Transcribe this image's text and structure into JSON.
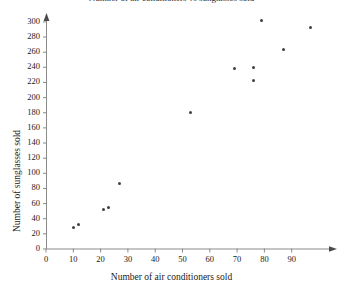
{
  "chart_data": {
    "type": "scatter",
    "title": "Number of air conditioners vs sunglasses sold",
    "xlabel": "Number of air conditioners sold",
    "ylabel": "Number of sunglasses sold",
    "xlim": [
      0,
      100
    ],
    "ylim": [
      0,
      310
    ],
    "xticks": [
      0,
      10,
      20,
      30,
      40,
      50,
      60,
      70,
      80,
      90
    ],
    "yticks": [
      0,
      20,
      40,
      60,
      80,
      100,
      120,
      140,
      160,
      180,
      200,
      220,
      240,
      260,
      280,
      300
    ],
    "grid": false,
    "legend": null,
    "marker_color": "#3f3f48",
    "axis_color": "#808080",
    "points": [
      {
        "x": 10,
        "y": 29
      },
      {
        "x": 12,
        "y": 33
      },
      {
        "x": 21,
        "y": 52
      },
      {
        "x": 23,
        "y": 55
      },
      {
        "x": 27,
        "y": 86
      },
      {
        "x": 53,
        "y": 180
      },
      {
        "x": 69,
        "y": 238
      },
      {
        "x": 76,
        "y": 222
      },
      {
        "x": 76,
        "y": 240
      },
      {
        "x": 79,
        "y": 302
      },
      {
        "x": 87,
        "y": 263
      },
      {
        "x": 97,
        "y": 293
      }
    ]
  },
  "axes_geometry": {
    "origin_x_px": 46,
    "origin_y_px": 249,
    "x_px_per_unit": 2.73,
    "y_px_per_unit": 0.757,
    "x_axis_end_px": 336,
    "y_axis_top_px": 14
  }
}
